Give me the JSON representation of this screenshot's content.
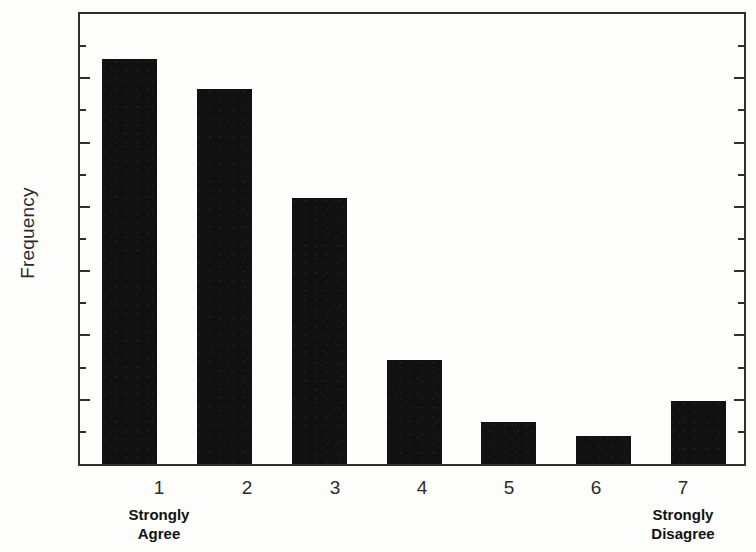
{
  "chart_data": {
    "type": "bar",
    "title": "",
    "xlabel": "",
    "ylabel": "Frequency",
    "categories": [
      "1",
      "2",
      "3",
      "4",
      "5",
      "6",
      "7"
    ],
    "values": [
      31.5,
      29.2,
      20.7,
      8.1,
      3.3,
      2.2,
      4.9
    ],
    "ylim": [
      0,
      35
    ],
    "y_ticks": [
      0,
      5,
      10,
      15,
      20,
      25,
      30,
      35
    ],
    "y_minor_tick_step": 2.5,
    "grid": false,
    "legend": null,
    "bar_color": "#111111",
    "axis_color": "#2f2f2f",
    "annotations": [
      {
        "text": "Strongly Agree",
        "at_category": "1",
        "position": "below-axis"
      },
      {
        "text": "Strongly Disagree",
        "at_category": "7",
        "position": "below-axis"
      }
    ]
  },
  "axis": {
    "y_title": "Frequency",
    "y_tick_labels": [
      "35",
      "30",
      "25",
      "20",
      "15",
      "10",
      "5",
      "0"
    ],
    "x_tick_labels": [
      "1",
      "2",
      "3",
      "4",
      "5",
      "6",
      "7"
    ]
  },
  "scale_anchors": {
    "low_line1": "Strongly",
    "low_line2": "Agree",
    "high_line1": "Strongly",
    "high_line2": "Disagree"
  }
}
